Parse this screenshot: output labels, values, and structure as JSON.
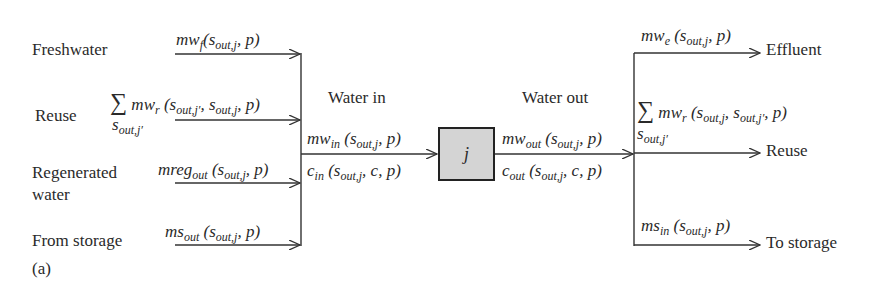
{
  "diagram": {
    "panel_label": "(a)",
    "unit": "j",
    "inputs": [
      {
        "label": "Freshwater",
        "flow": "mw_f (s_out,j, p)"
      },
      {
        "label": "Reuse",
        "flow": "Σ_{s_out,j'} mw_r (s_out,j', s_out,j, p)"
      },
      {
        "label": "Regenerated water",
        "flow": "mreg_out (s_out,j, p)"
      },
      {
        "label": "From storage",
        "flow": "ms_out (s_out,j, p)"
      }
    ],
    "water_in": {
      "title": "Water in",
      "flow": "mw_in (s_out,j, p)",
      "conc": "c_in (s_out,j, c, p)"
    },
    "water_out": {
      "title": "Water out",
      "flow": "mw_out (s_out,j, p)",
      "conc": "c_out (s_out,j, c, p)"
    },
    "outputs": [
      {
        "label": "Effluent",
        "flow": "mw_e (s_out,j, p)"
      },
      {
        "label": "Reuse",
        "flow": "Σ_{s_out,j'} mw_r (s_out,j, s_out,j', p)"
      },
      {
        "label": "To storage",
        "flow": "ms_in (s_out,j, p)"
      }
    ],
    "labels": {
      "freshwater": "Freshwater",
      "reuse_in": "Reuse",
      "regenerated_1": "Regenerated",
      "regenerated_2": "water",
      "from_storage": "From storage",
      "water_in": "Water in",
      "water_out": "Water out",
      "effluent": "Effluent",
      "reuse_out": "Reuse",
      "to_storage": "To storage",
      "panel": "(a)",
      "unit": "j"
    }
  }
}
